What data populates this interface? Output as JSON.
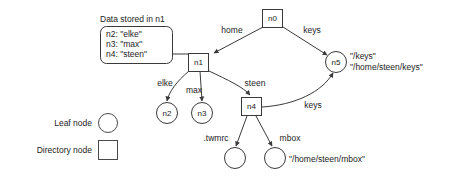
{
  "diagram": {
    "caption": "Data stored in n1",
    "data_box_lines": [
      "n2: \"elke\"",
      "n3: \"max\"",
      "n4: \"steen\""
    ],
    "nodes": [
      {
        "id": "n0",
        "label": "n0",
        "type": "directory",
        "x": 272.5,
        "y": 18.5
      },
      {
        "id": "n1",
        "label": "n1",
        "type": "directory",
        "x": 198.5,
        "y": 62.5
      },
      {
        "id": "n2",
        "label": "n2",
        "type": "leaf",
        "x": 167.0,
        "y": 113.0
      },
      {
        "id": "n3",
        "label": "n3",
        "type": "leaf",
        "x": 202.0,
        "y": 113.0
      },
      {
        "id": "n4",
        "label": "n4",
        "type": "directory",
        "x": 251.5,
        "y": 107.0
      },
      {
        "id": "n5",
        "label": "n5",
        "type": "leaf",
        "x": 336.0,
        "y": 62.0
      },
      {
        "id": "n6",
        "label": "",
        "type": "leaf",
        "x": 235.0,
        "y": 158.0
      },
      {
        "id": "n7",
        "label": "",
        "type": "leaf",
        "x": 275.0,
        "y": 158.0
      }
    ],
    "edges": [
      {
        "from": "n0",
        "to": "n1",
        "label": "home"
      },
      {
        "from": "n0",
        "to": "n5",
        "label": "keys"
      },
      {
        "from": "n1",
        "to": "n2",
        "label": "elke"
      },
      {
        "from": "n1",
        "to": "n3",
        "label": "max"
      },
      {
        "from": "n1",
        "to": "n4",
        "label": "steen"
      },
      {
        "from": "n4",
        "to": "n5",
        "label": "keys"
      },
      {
        "from": "n4",
        "to": "n6",
        "label": ".twmrc"
      },
      {
        "from": "n4",
        "to": "n7",
        "label": "mbox"
      }
    ],
    "edge_labels": {
      "home": "home",
      "keys_top": "keys",
      "elke": "elke",
      "max": "max",
      "steen": "steen",
      "keys_bottom": "keys",
      "twmrc": ".twmrc",
      "mbox": "mbox"
    },
    "annotations": [
      {
        "id": "n5-paths-line1",
        "text": "\"/keys\""
      },
      {
        "id": "n5-paths-line2",
        "text": "\"/home/steen/keys\""
      },
      {
        "id": "mbox-path",
        "text": "\"/home/steen/mbox\""
      }
    ],
    "legend": {
      "leaf_label": "Leaf node",
      "directory_label": "Directory node"
    },
    "colors": {
      "stroke": "#3a3a3a",
      "text": "#1c1c1c",
      "background": "#ffffff"
    }
  }
}
